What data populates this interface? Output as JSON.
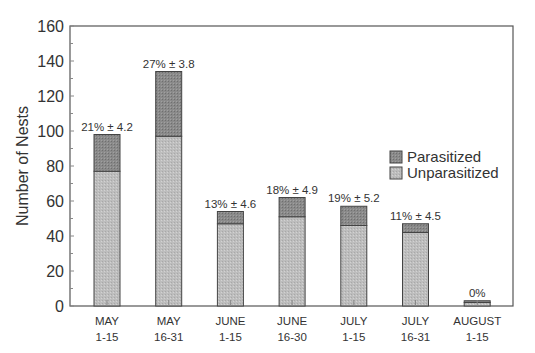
{
  "chart_data": {
    "type": "bar",
    "stacked": true,
    "title": "",
    "xlabel": "",
    "ylabel": "Number of Nests",
    "ylim": [
      0,
      160
    ],
    "yticks": [
      0,
      20,
      40,
      60,
      80,
      100,
      120,
      140,
      160
    ],
    "grid": false,
    "legend_position": "right-middle",
    "categories": [
      [
        "MAY",
        "1-15"
      ],
      [
        "MAY",
        "16-31"
      ],
      [
        "JUNE",
        "1-15"
      ],
      [
        "JUNE",
        "16-30"
      ],
      [
        "JULY",
        "1-15"
      ],
      [
        "JULY",
        "16-31"
      ],
      [
        "AUGUST",
        "1-15"
      ]
    ],
    "series": [
      {
        "name": "Unparasitized",
        "color": "#bdbdbd",
        "values": [
          77,
          97,
          47,
          51,
          46,
          42,
          2
        ]
      },
      {
        "name": "Parasitized",
        "color": "#8a8a8a",
        "values": [
          21,
          37,
          7,
          11,
          11,
          5,
          1
        ]
      }
    ],
    "totals": [
      98,
      134,
      54,
      62,
      57,
      47,
      3
    ],
    "annotations": [
      "21% ± 4.2",
      "27% ± 3.8",
      "13% ± 4.6",
      "18% ± 4.9",
      "19% ± 5.2",
      "11% ± 4.5",
      "0%"
    ]
  },
  "legend": {
    "items": [
      {
        "label": "Parasitized",
        "color": "#8a8a8a"
      },
      {
        "label": "Unparasitized",
        "color": "#bdbdbd"
      }
    ]
  }
}
